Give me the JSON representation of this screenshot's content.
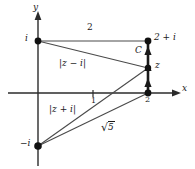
{
  "figure": {
    "background": "#ffffff",
    "stroke_color": "#1a1a1a",
    "width": 195,
    "height": 169
  },
  "axes": {
    "x_label": "x",
    "y_label": "y",
    "origin_px": [
      38,
      93
    ],
    "x_axis_from_px": [
      8,
      93
    ],
    "x_axis_to_px": [
      180,
      93
    ],
    "y_axis_from_px": [
      38,
      166
    ],
    "y_axis_to_px": [
      38,
      12
    ],
    "unit_x_px": 55,
    "unit_y_px": 52,
    "tick_label_one": "1",
    "tick_one_px": [
      93,
      93
    ]
  },
  "points": [
    {
      "name": "point-i",
      "label": "i",
      "coord": [
        0,
        1
      ],
      "px": [
        38,
        41
      ],
      "label_px": [
        26,
        35
      ],
      "label_align": "right"
    },
    {
      "name": "point-2-plus-i",
      "label": "2 + i",
      "coord": [
        2,
        1
      ],
      "px": [
        148,
        41
      ],
      "label_px": [
        154,
        34
      ],
      "label_align": "left"
    },
    {
      "name": "point-z",
      "label": "z",
      "coord": [
        2,
        0.48
      ],
      "px": [
        148,
        68
      ],
      "label_px": [
        154,
        62
      ],
      "label_align": "left"
    },
    {
      "name": "point-2",
      "label": "2",
      "coord": [
        2,
        0
      ],
      "px": [
        148,
        93
      ],
      "label_px": [
        145,
        98
      ],
      "label_align": "left"
    },
    {
      "name": "point-minus-i",
      "label": "−i",
      "coord": [
        0,
        -1
      ],
      "px": [
        38,
        146
      ],
      "label_px": [
        22,
        140
      ],
      "label_align": "right"
    }
  ],
  "segments": [
    {
      "name": "segment-i-to-2plusi",
      "from_px": [
        38,
        41
      ],
      "to_px": [
        148,
        41
      ],
      "label": "2",
      "label_px": [
        88,
        25
      ]
    },
    {
      "name": "segment-i-to-z",
      "from_px": [
        38,
        41
      ],
      "to_px": [
        148,
        68
      ],
      "label": "|z − i|",
      "label_px": [
        60,
        60
      ]
    },
    {
      "name": "segment-minusi-to-z",
      "from_px": [
        38,
        146
      ],
      "to_px": [
        148,
        68
      ],
      "label": "|z + i|",
      "label_px": [
        50,
        106
      ]
    },
    {
      "name": "segment-minusi-to-2",
      "from_px": [
        38,
        146
      ],
      "to_px": [
        148,
        93
      ],
      "label": "√5",
      "label_px": [
        104,
        124
      ]
    }
  ],
  "contour": {
    "name": "contour-C",
    "label": "C",
    "label_px": [
      136,
      48
    ],
    "from_px": [
      148,
      93
    ],
    "to_px": [
      148,
      41
    ],
    "direction": "upward",
    "arrow_count": 3
  },
  "radical_expression": {
    "symbol": "√",
    "radicand": "5"
  }
}
